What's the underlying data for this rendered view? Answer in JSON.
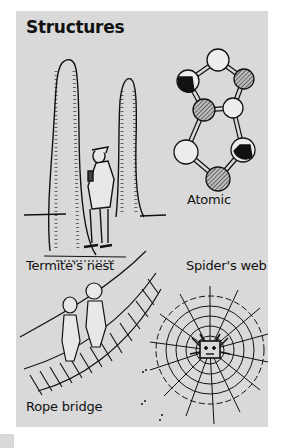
{
  "page": {
    "title": "Structures",
    "background_color": "#ffffff",
    "panel_color": "#d9d9d9"
  },
  "illustrations": [
    {
      "id": "termite",
      "label": "Termite's nest",
      "icon": "termite-mound-illustration"
    },
    {
      "id": "atomic",
      "label": "Atomic",
      "icon": "molecule-illustration"
    },
    {
      "id": "bridge",
      "label": "Rope bridge",
      "icon": "rope-bridge-illustration"
    },
    {
      "id": "web",
      "label": "Spider's web",
      "icon": "spider-web-illustration"
    }
  ],
  "molecule": {
    "atoms": [
      {
        "x": 202,
        "y": 49,
        "fill": "white"
      },
      {
        "x": 172,
        "y": 70,
        "fill": "black"
      },
      {
        "x": 228,
        "y": 68,
        "fill": "hatched"
      },
      {
        "x": 188,
        "y": 99,
        "fill": "hatched"
      },
      {
        "x": 217,
        "y": 97,
        "fill": "white"
      },
      {
        "x": 170,
        "y": 141,
        "fill": "white"
      },
      {
        "x": 227,
        "y": 139,
        "fill": "black"
      },
      {
        "x": 202,
        "y": 168,
        "fill": "hatched"
      }
    ]
  }
}
